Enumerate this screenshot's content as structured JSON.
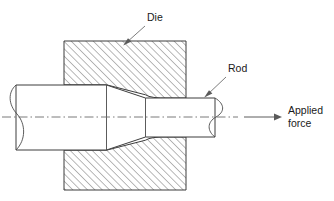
{
  "figure": {
    "type": "engineering-cross-section-diagram"
  },
  "labels": {
    "die": "Die",
    "rod": "Rod",
    "applied_force_line1": "Applied",
    "applied_force_line2": "force"
  },
  "colors": {
    "background": "#ffffff",
    "outline": "#3d3d3d",
    "hatch": "#6d6d6d",
    "centerline": "#6b6b6b",
    "leader": "#6e6e6e",
    "text": "#1a1a1a"
  },
  "geometry": {
    "die_block": {
      "x": 64,
      "y": 41,
      "width": 122,
      "height": 149
    },
    "rod_thick": {
      "top": 85,
      "bottom": 150,
      "left": 16
    },
    "rod_thin": {
      "top": 98,
      "bottom": 137,
      "right": 215
    },
    "centerline_y": 117,
    "taper_start_x": 106,
    "taper_end_x": 146
  },
  "annotations": [
    {
      "name": "die",
      "text": "Die",
      "text_x": 147,
      "text_y": 20,
      "points_to_x": 125,
      "points_to_y": 44
    },
    {
      "name": "rod",
      "text": "Rod",
      "text_x": 228,
      "text_y": 71,
      "points_to_x": 205,
      "points_to_y": 97
    },
    {
      "name": "applied-force",
      "text": "Applied force",
      "text_x": 288,
      "text_y": 118,
      "arrow_from_x": 238,
      "arrow_to_x": 281,
      "arrow_y": 117
    }
  ]
}
